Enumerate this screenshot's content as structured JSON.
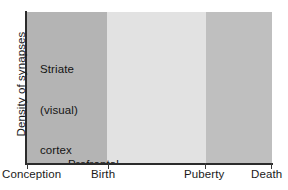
{
  "chart_data": {
    "type": "line",
    "title": "",
    "xlabel": "",
    "ylabel": "Density of synapses",
    "xlim": [
      0,
      100
    ],
    "ylim": [
      0,
      100
    ],
    "grid": false,
    "legend_position": "inline-annotations",
    "x_tick_labels": [
      "Conception",
      "Birth",
      "Puberty",
      "Death"
    ],
    "x_tick_values": [
      0,
      33,
      73,
      100
    ],
    "y_tick_labels": [],
    "background_bands": [
      {
        "label": "Conception to Birth",
        "x_start": 0,
        "x_end": 33,
        "color": "#b4b4b4"
      },
      {
        "label": "Birth to Puberty",
        "x_start": 33,
        "x_end": 73,
        "color": "#e2e2e2"
      },
      {
        "label": "Puberty to Death",
        "x_start": 73,
        "x_end": 100,
        "color": "#bfbfbf"
      }
    ],
    "series": [
      {
        "name": "Striate (visual) cortex",
        "color": "#111111",
        "x": [
          8.5,
          44.5,
          73.0,
          78.5,
          91.5,
          99.5
        ],
        "y": [
          27.5,
          99.0,
          44.0,
          42.0,
          38.0,
          25.0
        ]
      },
      {
        "name": "Prefrontal cortex",
        "color": "#111111",
        "x": [
          11.0,
          43.5,
          66.5,
          71.5,
          78.5,
          91.5,
          99.5
        ],
        "y": [
          15.5,
          99.0,
          99.0,
          45.5,
          45.5,
          40.5,
          21.5
        ]
      }
    ],
    "annotations": [
      {
        "name": "striate-label",
        "text": "Striate\n(visual)\ncortex",
        "x": 15,
        "y": 82
      },
      {
        "name": "prefrontal-label",
        "text": "Prefrontal\ncortex",
        "x": 27,
        "y": 18
      }
    ]
  },
  "axis": {
    "y_title": "Density of synapses"
  },
  "labels": {
    "conception": "Conception",
    "birth": "Birth",
    "puberty": "Puberty",
    "death": "Death"
  },
  "annotations": {
    "striate_line1": "Striate",
    "striate_line2": "(visual)",
    "striate_line3": "cortex",
    "prefrontal_line1": "Prefrontal",
    "prefrontal_line2": "cortex"
  },
  "colors": {
    "line": "#111111",
    "band_prenatal": "#b4b4b4",
    "band_childhood": "#e2e2e2",
    "band_adult": "#bfbfbf",
    "axis": "#2b2b2b",
    "text": "#141414"
  }
}
